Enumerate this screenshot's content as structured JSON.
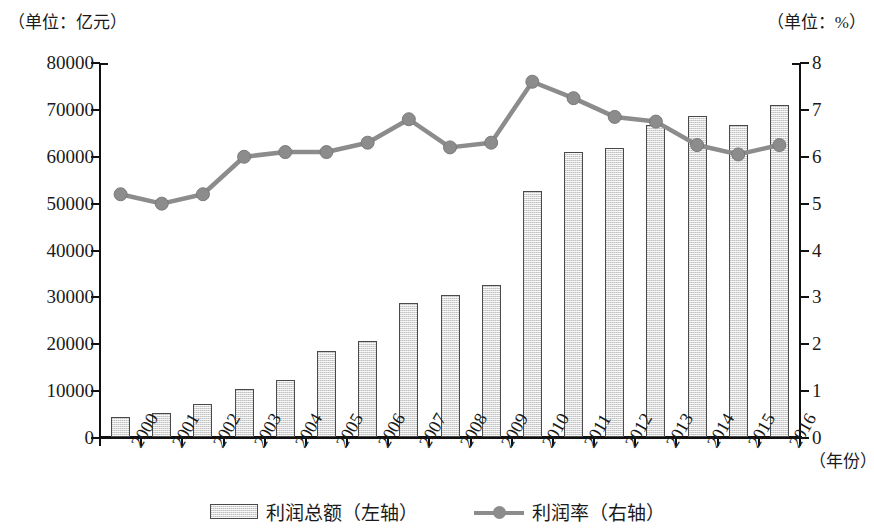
{
  "units": {
    "left": "（单位：亿元）",
    "right": "（单位：%）"
  },
  "axes": {
    "x_title": "（年份）",
    "left_ticks": [
      "0",
      "10000",
      "20000",
      "30000",
      "40000",
      "50000",
      "60000",
      "70000",
      "80000"
    ],
    "right_ticks": [
      "0",
      "1",
      "2",
      "3",
      "4",
      "5",
      "6",
      "7",
      "8"
    ]
  },
  "legend": {
    "bar_label": "利润总额（左轴）",
    "line_label": "利润率（右轴）"
  },
  "colors": {
    "bar_fill": "#d9d9d9",
    "bar_border": "#4a4a4a",
    "line": "#8c8c8c",
    "axis": "#111111",
    "text": "#1a1a1a"
  },
  "chart_data": {
    "type": "bar",
    "title": "",
    "xlabel": "（年份）",
    "ylabel": "（单位：亿元）",
    "y2label": "（单位：%）",
    "ylim": [
      0,
      80000
    ],
    "y2lim": [
      0,
      8
    ],
    "grid": false,
    "legend_position": "bottom",
    "categories": [
      "2000",
      "2001",
      "2002",
      "2003",
      "2004",
      "2005",
      "2006",
      "2007",
      "2008",
      "2009",
      "2010",
      "2011",
      "2012",
      "2013",
      "2014",
      "2015",
      "2016"
    ],
    "series": [
      {
        "name": "利润总额（左轴）",
        "type": "bar",
        "axis": "left",
        "unit": "亿元",
        "values": [
          4200,
          5200,
          7100,
          10300,
          12200,
          18300,
          20400,
          28500,
          30400,
          32400,
          52500,
          60700,
          61600,
          66600,
          68400,
          66500,
          70800
        ]
      },
      {
        "name": "利润率（右轴）",
        "type": "line",
        "axis": "right",
        "unit": "%",
        "values": [
          5.2,
          5.0,
          5.2,
          6.0,
          6.1,
          6.1,
          6.3,
          6.8,
          6.2,
          6.3,
          7.6,
          7.25,
          6.85,
          6.75,
          6.25,
          6.05,
          6.25
        ]
      }
    ]
  }
}
